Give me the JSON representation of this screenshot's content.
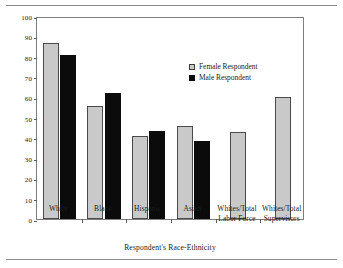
{
  "chart_data": {
    "type": "bar",
    "title": "",
    "xlabel": "Respondent's Race-Ethnicity",
    "ylabel": "Percentage",
    "ylim": [
      0,
      100
    ],
    "yticks": [
      0,
      10,
      20,
      30,
      40,
      50,
      60,
      70,
      80,
      90,
      100
    ],
    "grid": false,
    "legend_position": "upper-center-right",
    "categories": [
      "White",
      "Black",
      "Hispanic",
      "Asian",
      "Whites/Total Labor Force",
      "Whites/Total Supervisors"
    ],
    "category_lines": [
      [
        "White"
      ],
      [
        "Black"
      ],
      [
        "Hispanic"
      ],
      [
        "Asian"
      ],
      [
        "Whites/Total",
        "Labor Force"
      ],
      [
        "Whites/Total",
        "Supervisors"
      ]
    ],
    "series": [
      {
        "name": "Female Respondent",
        "color": "#c9c9c9",
        "values": [
          86.6,
          55.5,
          41.0,
          45.6,
          42.9,
          60.3
        ]
      },
      {
        "name": "Male Respondent",
        "color": "#0b0b0b",
        "values": [
          80.6,
          62.2,
          43.3,
          38.2,
          null,
          null
        ]
      }
    ]
  },
  "legend": {
    "items": [
      {
        "label": "Female Respondent",
        "swatch": "female"
      },
      {
        "label": "Male Respondent",
        "swatch": "male"
      }
    ]
  }
}
